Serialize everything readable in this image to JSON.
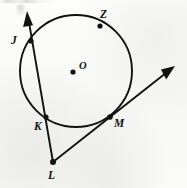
{
  "figure": {
    "background_color": "#fbfbfa",
    "ink_color": "#121212",
    "width": 187,
    "height": 188
  },
  "circle": {
    "name": "circle-O",
    "center_x": 76,
    "center_y": 71,
    "radius": 56,
    "stroke_width": 1.9
  },
  "center_point": {
    "label": "O",
    "dot_x": 73,
    "dot_y": 72,
    "dot_radius": 2.6,
    "label_x": 79,
    "label_y": 61
  },
  "points": [
    {
      "id": "J",
      "label": "J",
      "x": 31,
      "y": 41,
      "dot_radius": 2.6,
      "label_x": 11,
      "label_y": 35,
      "on_circle": true
    },
    {
      "id": "Z",
      "label": "Z",
      "x": 100,
      "y": 26,
      "dot_radius": 2.6,
      "label_x": 100,
      "label_y": 9,
      "on_circle": true
    },
    {
      "id": "K",
      "label": "K",
      "x": 46,
      "y": 117,
      "dot_radius": 2.6,
      "label_x": 34,
      "label_y": 121,
      "on_circle": true
    },
    {
      "id": "M",
      "label": "M",
      "x": 110,
      "y": 117,
      "dot_radius": 2.8,
      "label_x": 114,
      "label_y": 118,
      "on_circle": true
    },
    {
      "id": "L",
      "label": "L",
      "x": 53,
      "y": 162,
      "dot_radius": 3.0,
      "label_x": 48,
      "label_y": 170,
      "on_circle": false
    }
  ],
  "rays": [
    {
      "id": "ray-LJ",
      "name": "secant-ray-through-K-and-J",
      "from_x": 53,
      "from_y": 162,
      "to_x": 27,
      "to_y": 11,
      "arrowhead": true,
      "stroke_width": 1.9,
      "passes_through": [
        "K",
        "J"
      ]
    },
    {
      "id": "ray-LM",
      "name": "secant-ray-through-M",
      "from_x": 53,
      "from_y": 162,
      "to_x": 175,
      "to_y": 66,
      "arrowhead": true,
      "stroke_width": 1.9,
      "passes_through": [
        "M"
      ]
    }
  ],
  "arrowheads": [
    {
      "id": "arrow-top",
      "tip_x": 27,
      "tip_y": 11,
      "angle_deg": 260
    },
    {
      "id": "arrow-right",
      "tip_x": 175,
      "tip_y": 66,
      "angle_deg": 322
    }
  ]
}
